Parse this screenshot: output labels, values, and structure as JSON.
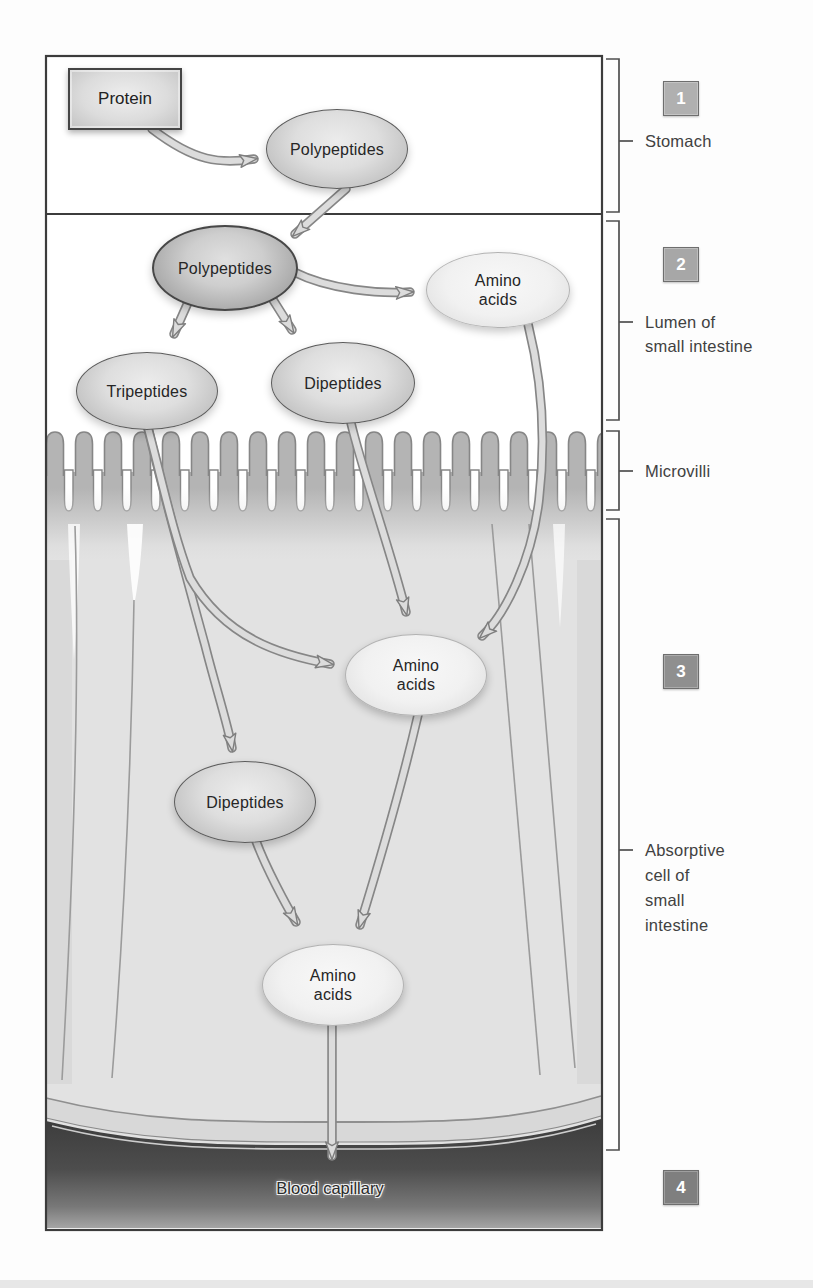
{
  "nodes": {
    "protein": "Protein",
    "polypeptides_stomach": "Polypeptides",
    "polypeptides_lumen": "Polypeptides",
    "tripeptides": "Tripeptides",
    "dipeptides_lumen": "Dipeptides",
    "amino_acids_lumen": {
      "line1": "Amino",
      "line2": "acids"
    },
    "amino_acids_cell": {
      "line1": "Amino",
      "line2": "acids"
    },
    "dipeptides_cell": "Dipeptides",
    "amino_acids_basal": {
      "line1": "Amino",
      "line2": "acids"
    },
    "blood_capillary_label": "Blood capillary"
  },
  "legend": {
    "step1": {
      "number": "1",
      "label": "Stomach"
    },
    "step2": {
      "number": "2",
      "label_line1": "Lumen of",
      "label_line2": "small intestine"
    },
    "microvilli": {
      "label": "Microvilli"
    },
    "step3": {
      "number": "3",
      "label_line1": "Absorptive",
      "label_line2": "cell of",
      "label_line3": "small",
      "label_line4": "intestine"
    },
    "step4": {
      "number": "4"
    }
  },
  "colors": {
    "node_border_dark": "#474747",
    "node_fill_light": "#f3f3f3",
    "node_fill_gray": "#c9c9c9",
    "arrow_fill": "#dcdcdc",
    "arrow_outline": "#868686",
    "microvilli_gray": "#b4b4b4",
    "cell_interior": "#e2e2e2",
    "capillary_dark": "#3d3d3d",
    "badge_gray_light": "#b0b0b0",
    "badge_gray_dark": "#7f7f7f"
  }
}
